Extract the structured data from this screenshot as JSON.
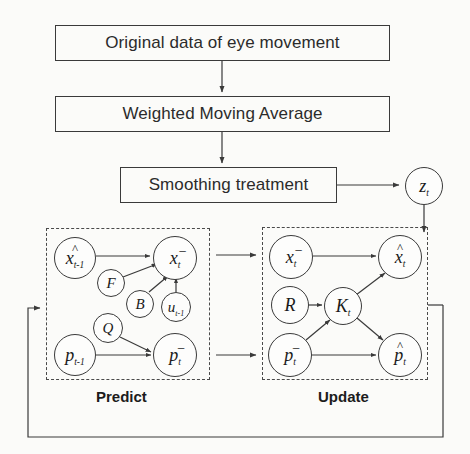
{
  "diagram": {
    "type": "flowchart-graphical-model"
  },
  "pipeline": {
    "boxes": [
      {
        "id": "original-data",
        "label": "Original data of eye movement",
        "x": 55,
        "y": 25,
        "w": 335,
        "h": 36
      },
      {
        "id": "weighted-moving-average",
        "label": "Weighted Moving Average",
        "x": 55,
        "y": 96,
        "w": 335,
        "h": 36
      },
      {
        "id": "smoothing-treatment",
        "label": "Smoothing treatment",
        "x": 120,
        "y": 167,
        "w": 217,
        "h": 36
      }
    ]
  },
  "phases": [
    {
      "id": "predict",
      "label": "Predict",
      "box": {
        "x": 46,
        "y": 228,
        "w": 164,
        "h": 152
      },
      "label_x": 96,
      "label_y": 388
    },
    {
      "id": "update",
      "label": "Update",
      "box": {
        "x": 262,
        "y": 227,
        "w": 166,
        "h": 153
      },
      "label_x": 318,
      "label_y": 388
    }
  ],
  "nodes": {
    "measurement": [
      {
        "id": "z-t",
        "base": "z",
        "sub": "t",
        "hat": false,
        "minus": false,
        "cx": 424,
        "cy": 186,
        "r": 19
      }
    ],
    "predict": [
      {
        "id": "x-hat-t-minus-1",
        "base": "x",
        "sub": "t‑1",
        "hat": true,
        "minus": false,
        "cx": 75,
        "cy": 258,
        "r": 21
      },
      {
        "id": "x-prior-t",
        "base": "x",
        "sub": "t",
        "hat": false,
        "minus": true,
        "cx": 175,
        "cy": 258,
        "r": 22
      },
      {
        "id": "F",
        "base": "F",
        "sub": "",
        "hat": false,
        "minus": false,
        "cx": 111,
        "cy": 283,
        "r": 14
      },
      {
        "id": "B",
        "base": "B",
        "sub": "",
        "hat": false,
        "minus": false,
        "cx": 140,
        "cy": 304,
        "r": 14
      },
      {
        "id": "u-t-minus-1",
        "base": "u",
        "sub": "t‑1",
        "hat": false,
        "minus": false,
        "cx": 176,
        "cy": 307,
        "r": 15
      },
      {
        "id": "Q",
        "base": "Q",
        "sub": "",
        "hat": false,
        "minus": false,
        "cx": 108,
        "cy": 328,
        "r": 15
      },
      {
        "id": "p-t-minus-1",
        "base": "p",
        "sub": "t‑1",
        "hat": false,
        "minus": false,
        "cx": 75,
        "cy": 355,
        "r": 21
      },
      {
        "id": "p-prior-t",
        "base": "p",
        "sub": "t",
        "hat": false,
        "minus": true,
        "cx": 175,
        "cy": 355,
        "r": 22
      }
    ],
    "update": [
      {
        "id": "x-prior-t-upd",
        "base": "x",
        "sub": "t",
        "hat": false,
        "minus": true,
        "cx": 291,
        "cy": 257,
        "r": 22
      },
      {
        "id": "x-hat-t",
        "base": "x",
        "sub": "t",
        "hat": true,
        "minus": false,
        "cx": 400,
        "cy": 257,
        "r": 22
      },
      {
        "id": "R",
        "base": "R",
        "sub": "",
        "hat": false,
        "minus": false,
        "cx": 290,
        "cy": 305,
        "r": 19
      },
      {
        "id": "K-t",
        "base": "K",
        "sub": "t",
        "hat": false,
        "minus": false,
        "cx": 343,
        "cy": 306,
        "r": 19
      },
      {
        "id": "p-prior-t-upd",
        "base": "p",
        "sub": "t",
        "hat": false,
        "minus": true,
        "cx": 290,
        "cy": 355,
        "r": 22
      },
      {
        "id": "p-hat-t",
        "base": "p",
        "sub": "t",
        "hat": true,
        "minus": false,
        "cx": 400,
        "cy": 355,
        "r": 22
      }
    ]
  },
  "edges": [
    {
      "from": "original-data",
      "to": "weighted-moving-average"
    },
    {
      "from": "weighted-moving-average",
      "to": "smoothing-treatment"
    },
    {
      "from": "smoothing-treatment",
      "to": "z-t"
    },
    {
      "from": "z-t",
      "to": "x-hat-t"
    },
    {
      "from": "x-hat-t-minus-1",
      "to": "x-prior-t"
    },
    {
      "from": "F",
      "to": "x-prior-t"
    },
    {
      "from": "B",
      "to": "x-prior-t"
    },
    {
      "from": "u-t-minus-1",
      "to": "x-prior-t"
    },
    {
      "from": "Q",
      "to": "p-prior-t"
    },
    {
      "from": "p-t-minus-1",
      "to": "p-prior-t"
    },
    {
      "from": "x-prior-t",
      "to": "x-prior-t-upd"
    },
    {
      "from": "p-prior-t",
      "to": "p-prior-t-upd"
    },
    {
      "from": "x-prior-t-upd",
      "to": "x-hat-t"
    },
    {
      "from": "R",
      "to": "K-t"
    },
    {
      "from": "p-prior-t-upd",
      "to": "K-t"
    },
    {
      "from": "K-t",
      "to": "x-hat-t"
    },
    {
      "from": "K-t",
      "to": "p-hat-t"
    },
    {
      "from": "p-prior-t-upd",
      "to": "p-hat-t"
    },
    {
      "from": "update-phase",
      "to": "predict-phase",
      "kind": "feedback-loop"
    }
  ],
  "style": {
    "stroke": "#3a3a3a",
    "dashed_stroke": "#4a4a4a",
    "text": "#1c1c1c",
    "background": "#fbfbf9"
  }
}
